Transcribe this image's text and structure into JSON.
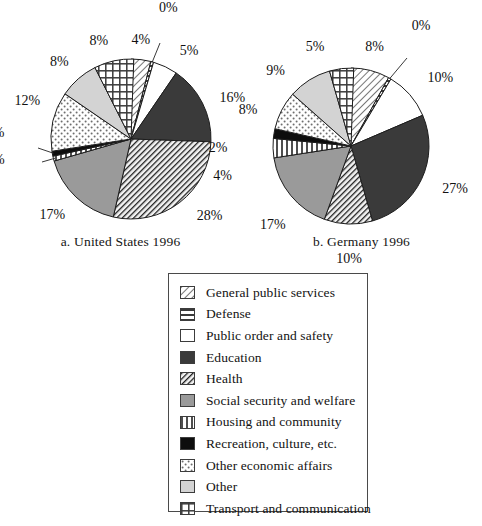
{
  "figure": {
    "title": "",
    "panels": [
      {
        "id": "us",
        "caption": "a. United States 1996"
      },
      {
        "id": "de",
        "caption": "b. Germany 1996"
      }
    ]
  },
  "legend": {
    "items": [
      {
        "label": "General public services",
        "pattern": "diagonal-hatch-light",
        "color": "#ffffff"
      },
      {
        "label": "Defense",
        "pattern": "horizontal-lines",
        "color": "#ffffff"
      },
      {
        "label": "Public order and safety",
        "pattern": "solid-white",
        "color": "#ffffff"
      },
      {
        "label": "Education",
        "pattern": "solid-dark-gray",
        "color": "#3a3a3a"
      },
      {
        "label": "Health",
        "pattern": "dense-diagonal-hatch",
        "color": "#2b2b2b"
      },
      {
        "label": "Social security and welfare",
        "pattern": "solid-medium-gray",
        "color": "#9a9a9a"
      },
      {
        "label": "Housing and community",
        "pattern": "vertical-lines",
        "color": "#ffffff"
      },
      {
        "label": "Recreation, culture, etc.",
        "pattern": "solid-black",
        "color": "#0d0d0d"
      },
      {
        "label": "Other economic affairs",
        "pattern": "stipple-dots",
        "color": "#ffffff"
      },
      {
        "label": "Other",
        "pattern": "solid-light-gray",
        "color": "#d3d3d3"
      },
      {
        "label": "Transport and communication",
        "pattern": "grid-crosshatch",
        "color": "#ffffff"
      }
    ]
  },
  "chart_data": [
    {
      "type": "pie",
      "title": "a. United States 1996",
      "xlabel": "",
      "ylabel": "",
      "units": "percent",
      "start_angle_deg": 0,
      "direction": "clockwise",
      "categories": [
        "General public services",
        "Defense",
        "Public order and safety",
        "Education",
        "Health",
        "Social security and welfare",
        "Housing and community",
        "Recreation, culture, etc.",
        "Other economic affairs",
        "Other",
        "Transport and communication"
      ],
      "values": [
        4,
        0,
        5,
        16,
        28,
        17,
        1,
        1,
        12,
        8,
        8
      ],
      "labels": [
        "4%",
        "0%",
        "5%",
        "16%",
        "28%",
        "17%",
        "1%",
        "1%",
        "12%",
        "8%",
        "8%"
      ]
    },
    {
      "type": "pie",
      "title": "b. Germany 1996",
      "xlabel": "",
      "ylabel": "",
      "units": "percent",
      "start_angle_deg": 0,
      "direction": "clockwise",
      "categories": [
        "General public services",
        "Defense",
        "Public order and safety",
        "Education",
        "Health",
        "Social security and welfare",
        "Housing and community",
        "Recreation, culture, etc.",
        "Other economic affairs",
        "Other",
        "Transport and communication"
      ],
      "values": [
        8,
        0,
        10,
        27,
        10,
        17,
        4,
        2,
        8,
        9,
        5
      ],
      "labels": [
        "8%",
        "0%",
        "10%",
        "27%",
        "10%",
        "17%",
        "4%",
        "2%",
        "8%",
        "9%",
        "5%"
      ]
    }
  ]
}
